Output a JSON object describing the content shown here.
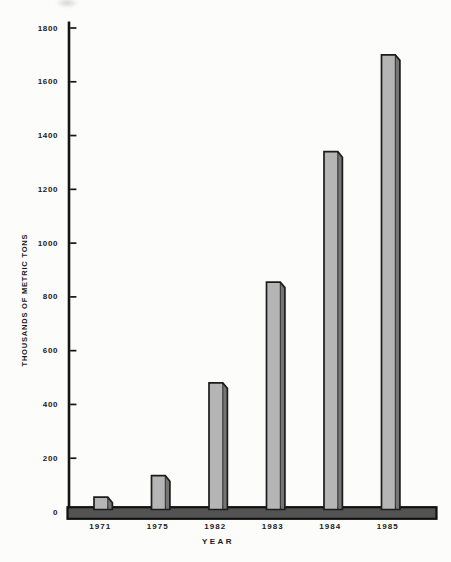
{
  "chart_data": {
    "type": "bar",
    "title": "",
    "xlabel": "YEAR",
    "ylabel": "THOUSANDS OF METRIC TONS",
    "categories": [
      "1971",
      "1975",
      "1982",
      "1983",
      "1984",
      "1985"
    ],
    "values": [
      55,
      135,
      480,
      855,
      1340,
      1700
    ],
    "series_name": "production",
    "ylim": [
      0,
      1800
    ],
    "ytick_interval": 200,
    "ytick_labels": [
      "0",
      "200",
      "400",
      "600",
      "800",
      "1000",
      "1200",
      "1400",
      "1600",
      "1800"
    ],
    "grid": false,
    "legend": "none",
    "bar_style": "pseudo-3d chamfered top-right, monochrome print",
    "colors": {
      "background": "#fcfcfb",
      "bar_face": "#b5b5b5",
      "bar_side": "#757575",
      "bar_outline": "#1c1c1c",
      "axis": "#141414",
      "base_band_fill": "#535353",
      "base_band_outline": "#101010",
      "text": "#1a1a1a"
    }
  }
}
